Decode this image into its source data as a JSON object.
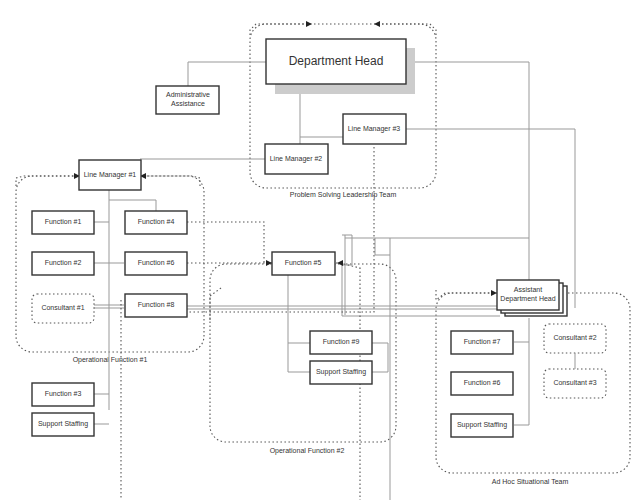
{
  "diagram": {
    "type": "org-chart",
    "groups": {
      "leadership": "Problem Solving Leadership Team",
      "op1": "Operational Function #1",
      "op2": "Operational Function #2",
      "adhoc": "Ad Hoc Situational Team"
    },
    "nodes": {
      "dept_head": "Department Head",
      "admin_1": "Administrative",
      "admin_2": "Assistance",
      "lm1": "Line Manager #1",
      "lm2": "Line Manager #2",
      "lm3": "Line Manager #3",
      "f1": "Function #1",
      "f2": "Function #2",
      "f3": "Function #3",
      "f4": "Function #4",
      "f6a": "Function #6",
      "f8": "Function #8",
      "c1": "Consultant #1",
      "ss1": "Support Staffing",
      "f5": "Function #5",
      "f9": "Function #9",
      "ss2": "Support Staffing",
      "adh_1": "Assistant",
      "adh_2": "Department Head",
      "f7": "Function #7",
      "f6b": "Function #6",
      "ss3": "Support Staffing",
      "c2": "Consultant #2",
      "c3": "Consultant #3"
    }
  }
}
